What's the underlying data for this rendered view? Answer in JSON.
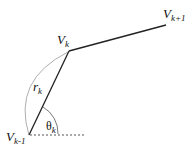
{
  "diagram": {
    "vertices": [
      {
        "id": "v_km1",
        "main": "V",
        "sub": "k-1"
      },
      {
        "id": "v_k",
        "main": "V",
        "sub": "k"
      },
      {
        "id": "v_kp1",
        "main": "V",
        "sub": "k+1"
      }
    ],
    "radius_label": {
      "main": "r",
      "sub": "k"
    },
    "angle_label": {
      "main": "θ",
      "sub": "k"
    },
    "colors": {
      "segment": "#222222",
      "arc": "#999999",
      "reference": "#555555"
    }
  }
}
